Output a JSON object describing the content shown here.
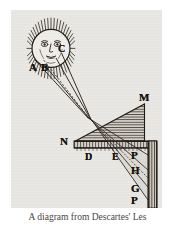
{
  "figure": {
    "caption": "A diagram from Descartes' Les",
    "plate_background": "#e9e7e3",
    "ink_color": "#1b1610",
    "paper_color": "#ffffff"
  },
  "labels": [
    {
      "id": "A",
      "text": "A",
      "x": 18,
      "y": 52,
      "size": 11
    },
    {
      "id": "B",
      "text": "B",
      "x": 30,
      "y": 52,
      "size": 11
    },
    {
      "id": "C",
      "text": "C",
      "x": 47,
      "y": 34,
      "size": 10
    },
    {
      "id": "M",
      "text": "M",
      "x": 128,
      "y": 89,
      "size": 11
    },
    {
      "id": "N",
      "text": "N",
      "x": 58,
      "y": 138,
      "size": 11
    },
    {
      "id": "D",
      "text": "D",
      "x": 74,
      "y": 150,
      "size": 10
    },
    {
      "id": "E",
      "text": "E",
      "x": 101,
      "y": 150,
      "size": 10
    },
    {
      "id": "P",
      "text": "P",
      "x": 120,
      "y": 148,
      "size": 11
    },
    {
      "id": "H",
      "text": "H",
      "x": 120,
      "y": 163,
      "size": 11
    },
    {
      "id": "G",
      "text": "G",
      "x": 120,
      "y": 181,
      "size": 11
    },
    {
      "id": "F",
      "text": "P",
      "x": 120,
      "y": 193,
      "size": 11
    }
  ],
  "elements": {
    "sun": {
      "name": "sun-with-face",
      "cx": 40,
      "cy": 38,
      "r": 19,
      "ray_count": 44
    },
    "prism": {
      "name": "triangular-prism",
      "apex_top": "M",
      "left_vertex": "N"
    },
    "screen": {
      "name": "vertical-hatched-wall"
    },
    "base": {
      "name": "horizontal-hatched-bar"
    },
    "light_rays": {
      "name": "refracted-light-rays",
      "count": 4
    }
  }
}
